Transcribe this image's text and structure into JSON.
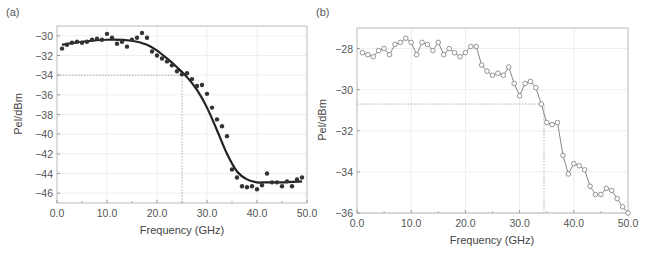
{
  "chart_data": [
    {
      "panel": "(a)",
      "type": "scatter",
      "xlabel": "Frequency (GHz)",
      "ylabel": "Pel/dBm",
      "xlim": [
        0,
        50
      ],
      "ylim": [
        -47,
        -29
      ],
      "x_ticks": [
        "0.0",
        "10.0",
        "20.0",
        "30.0",
        "40.0",
        "50.0"
      ],
      "y_ticks": [
        "-30",
        "-32",
        "-34",
        "-36",
        "-38",
        "-40",
        "-42",
        "-44",
        "-46"
      ],
      "grid": true,
      "reference_lines": {
        "x": 25,
        "y": -34
      },
      "series": [
        {
          "name": "measured",
          "style": "filled-dots",
          "x": [
            1,
            2,
            3,
            4,
            5,
            6,
            7,
            8,
            9,
            10,
            11,
            12,
            13,
            14,
            15,
            16,
            17,
            18,
            19,
            20,
            21,
            22,
            23,
            24,
            25,
            26,
            27,
            28,
            29,
            30,
            31,
            32,
            33,
            34,
            35,
            36,
            37,
            38,
            39,
            40,
            41,
            42,
            43,
            44,
            45,
            46,
            47,
            48,
            49
          ],
          "y": [
            -31.3,
            -30.9,
            -30.7,
            -30.6,
            -30.7,
            -30.6,
            -30.4,
            -30.3,
            -30.4,
            -29.8,
            -30.2,
            -30.8,
            -30.6,
            -31.1,
            -30.4,
            -30.2,
            -29.7,
            -30.2,
            -31.6,
            -32.0,
            -32.3,
            -32.6,
            -33.0,
            -33.6,
            -33.9,
            -33.8,
            -34.4,
            -35.1,
            -35.0,
            -35.9,
            -37.3,
            -38.5,
            -39.2,
            -40.2,
            -43.6,
            -44.4,
            -45.3,
            -45.4,
            -45.3,
            -45.6,
            -45.2,
            -44.0,
            -44.9,
            -44.9,
            -45.3,
            -44.8,
            -45.3,
            -44.6,
            -44.4
          ]
        },
        {
          "name": "fit",
          "style": "solid-line",
          "x": [
            1,
            5,
            10,
            15,
            18,
            20,
            22,
            24,
            26,
            28,
            30,
            32,
            34,
            36,
            38,
            40,
            42,
            45,
            49
          ],
          "y": [
            -30.9,
            -30.6,
            -30.4,
            -30.5,
            -30.9,
            -31.5,
            -32.3,
            -33.2,
            -34.2,
            -35.5,
            -37.3,
            -39.6,
            -42.0,
            -43.8,
            -44.6,
            -44.9,
            -44.9,
            -44.9,
            -44.8
          ]
        }
      ]
    },
    {
      "panel": "(b)",
      "type": "line",
      "xlabel": "Frequency (GHz)",
      "ylabel": "Pel/dBm",
      "xlim": [
        0,
        50
      ],
      "ylim": [
        -36,
        -27
      ],
      "x_ticks": [
        "0.0",
        "10.0",
        "20.0",
        "30.0",
        "40.0",
        "50.0"
      ],
      "y_ticks": [
        "-28",
        "-30",
        "-32",
        "-34",
        "-36"
      ],
      "grid": true,
      "reference_lines": {
        "x": 34.5,
        "y": -30.7
      },
      "series": [
        {
          "name": "measured",
          "style": "line-open-circles",
          "x": [
            1,
            2,
            3,
            4,
            5,
            6,
            7,
            8,
            9,
            10,
            11,
            12,
            13,
            14,
            15,
            16,
            17,
            18,
            19,
            20,
            21,
            22,
            23,
            24,
            25,
            26,
            27,
            28,
            29,
            30,
            31,
            32,
            33,
            34,
            35,
            36,
            37,
            38,
            39,
            40,
            41,
            42,
            43,
            44,
            45,
            46,
            47,
            48,
            49,
            50
          ],
          "y": [
            -28.2,
            -28.3,
            -28.4,
            -28.1,
            -28.0,
            -28.3,
            -27.8,
            -27.7,
            -27.5,
            -27.7,
            -28.3,
            -27.7,
            -27.8,
            -28.1,
            -27.7,
            -28.3,
            -28.0,
            -28.2,
            -28.4,
            -28.2,
            -27.9,
            -27.9,
            -28.8,
            -29.1,
            -29.3,
            -29.2,
            -29.3,
            -28.9,
            -29.7,
            -30.3,
            -29.7,
            -29.6,
            -29.9,
            -30.7,
            -31.6,
            -31.7,
            -31.6,
            -33.2,
            -34.1,
            -33.6,
            -33.7,
            -33.9,
            -34.7,
            -35.1,
            -35.1,
            -34.8,
            -34.9,
            -35.3,
            -35.7,
            -36.0
          ]
        }
      ]
    }
  ],
  "panels": {
    "a": {
      "label": "(a)",
      "xlabel": "Frequency (GHz)",
      "ylabel": "Pel/dBm"
    },
    "b": {
      "label": "(b)",
      "xlabel": "Frequency (GHz)",
      "ylabel": "Pel/dBm"
    }
  },
  "colors": {
    "axis": "#888888",
    "grid": "#eeeeee",
    "series_a": "#333333",
    "series_b": "#888888",
    "reference": "#999999"
  }
}
